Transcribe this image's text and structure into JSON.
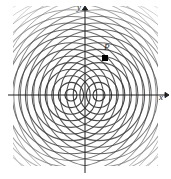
{
  "figure": {
    "axes": {
      "y_label": "y",
      "x_label": "x",
      "origin": {
        "x": 85,
        "y": 95
      },
      "x_axis_from": 8,
      "x_axis_to": 165,
      "y_axis_from": 10,
      "y_axis_to": 173
    },
    "point": {
      "label": "P",
      "marker": "filled-square-dot",
      "x": 105,
      "y": 58
    },
    "sources": [
      {
        "name": "source-left",
        "cx": 71,
        "cy": 95
      },
      {
        "name": "source-right",
        "cx": 99,
        "cy": 95
      }
    ],
    "wave": {
      "ring_count": 17,
      "ring_spacing": 6.6,
      "first_radius": 6.0,
      "clip_left": 13,
      "clip_top": 6,
      "clip_right": 158,
      "clip_bottom": 166
    },
    "colors": {
      "ink": "#2a2a2a",
      "wave": "#3a3a3a",
      "wave_faint": "#8c8c8c",
      "background": "#ffffff",
      "marker": "#000000"
    }
  }
}
